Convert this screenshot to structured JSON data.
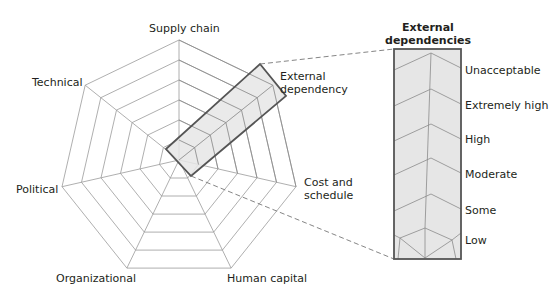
{
  "radar": {
    "center": [
      179,
      160
    ],
    "radius": 120,
    "rings": 6,
    "axes": [
      {
        "label": "Supply chain",
        "lines": [
          "Supply chain"
        ]
      },
      {
        "label": "External dependency",
        "lines": [
          "External",
          "dependency"
        ]
      },
      {
        "label": "Cost and schedule",
        "lines": [
          "Cost and",
          "schedule"
        ]
      },
      {
        "label": "Human capital",
        "lines": [
          "Human capital"
        ]
      },
      {
        "label": "Organizational",
        "lines": [
          "Organizational"
        ]
      },
      {
        "label": "Political",
        "lines": [
          "Political"
        ]
      },
      {
        "label": "Technical",
        "lines": [
          "Technical"
        ]
      }
    ],
    "highlight_axis": "External dependency",
    "highlight_fill": "#e6e6e6",
    "grid_color": "#9a9a9a",
    "outline_color": "#555555"
  },
  "detail_panel": {
    "title_line1": "External",
    "title_line2": "dependencies",
    "levels": [
      "Unacceptable",
      "Extremely high",
      "High",
      "Moderate",
      "Some",
      "Low"
    ],
    "fill": "#e6e6e6"
  },
  "labels": {
    "supply_chain": "Supply chain",
    "external_1": "External",
    "external_2": "dependency",
    "cost_1": "Cost and",
    "cost_2": "schedule",
    "human_capital": "Human capital",
    "organizational": "Organizational",
    "political": "Political",
    "technical": "Technical"
  }
}
